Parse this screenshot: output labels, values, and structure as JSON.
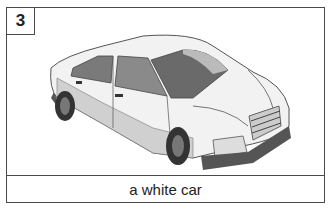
{
  "card": {
    "number": "3",
    "caption": "a white car",
    "image": {
      "subject": "car",
      "color": "white",
      "icon": "car-illustration"
    }
  }
}
